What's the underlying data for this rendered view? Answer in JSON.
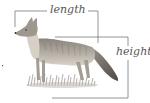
{
  "diagram": {
    "labels": {
      "length": "length",
      "height": "height"
    },
    "colors": {
      "bracket_line": "#7a7a7a",
      "label_text": "#555555",
      "fur_dark": "#6b6560",
      "fur_light": "#c9c2b8",
      "grass": "#7d7a72",
      "background": "#ffffff"
    }
  }
}
